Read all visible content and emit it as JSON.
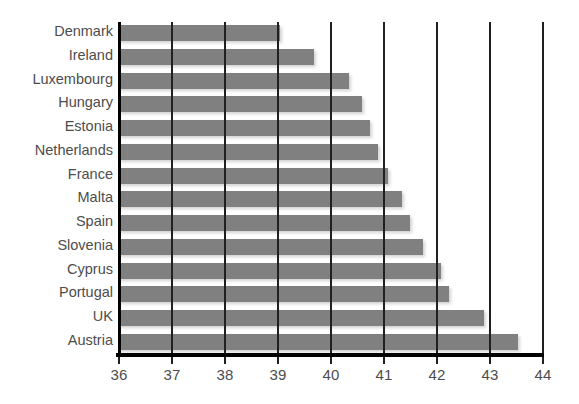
{
  "chart_data": {
    "type": "bar",
    "orientation": "horizontal",
    "title": "",
    "subtitle": "",
    "xlabel": "",
    "ylabel": "",
    "xlim": [
      36,
      44
    ],
    "xticks": [
      36,
      37,
      38,
      39,
      40,
      41,
      42,
      43,
      44
    ],
    "xtick_labels": [
      "36",
      "37",
      "38",
      "39",
      "40",
      "41",
      "42",
      "43",
      "44"
    ],
    "grid": "vertical",
    "legend": "none",
    "bar_color": "#808080",
    "axis_color": "#000000",
    "gridline_color": "#231f20",
    "label_color": "#4d4d4d",
    "background_color": "#ffffff",
    "categories": [
      "Denmark",
      "Ireland",
      "Luxembourg",
      "Hungary",
      "Estonia",
      "Netherlands",
      "France",
      "Malta",
      "Spain",
      "Slovenia",
      "Cyprus",
      "Portugal",
      "UK",
      "Austria"
    ],
    "values": [
      39.05,
      39.7,
      40.35,
      40.6,
      40.75,
      40.9,
      41.1,
      41.35,
      41.5,
      41.75,
      42.1,
      42.25,
      42.9,
      43.55
    ]
  }
}
